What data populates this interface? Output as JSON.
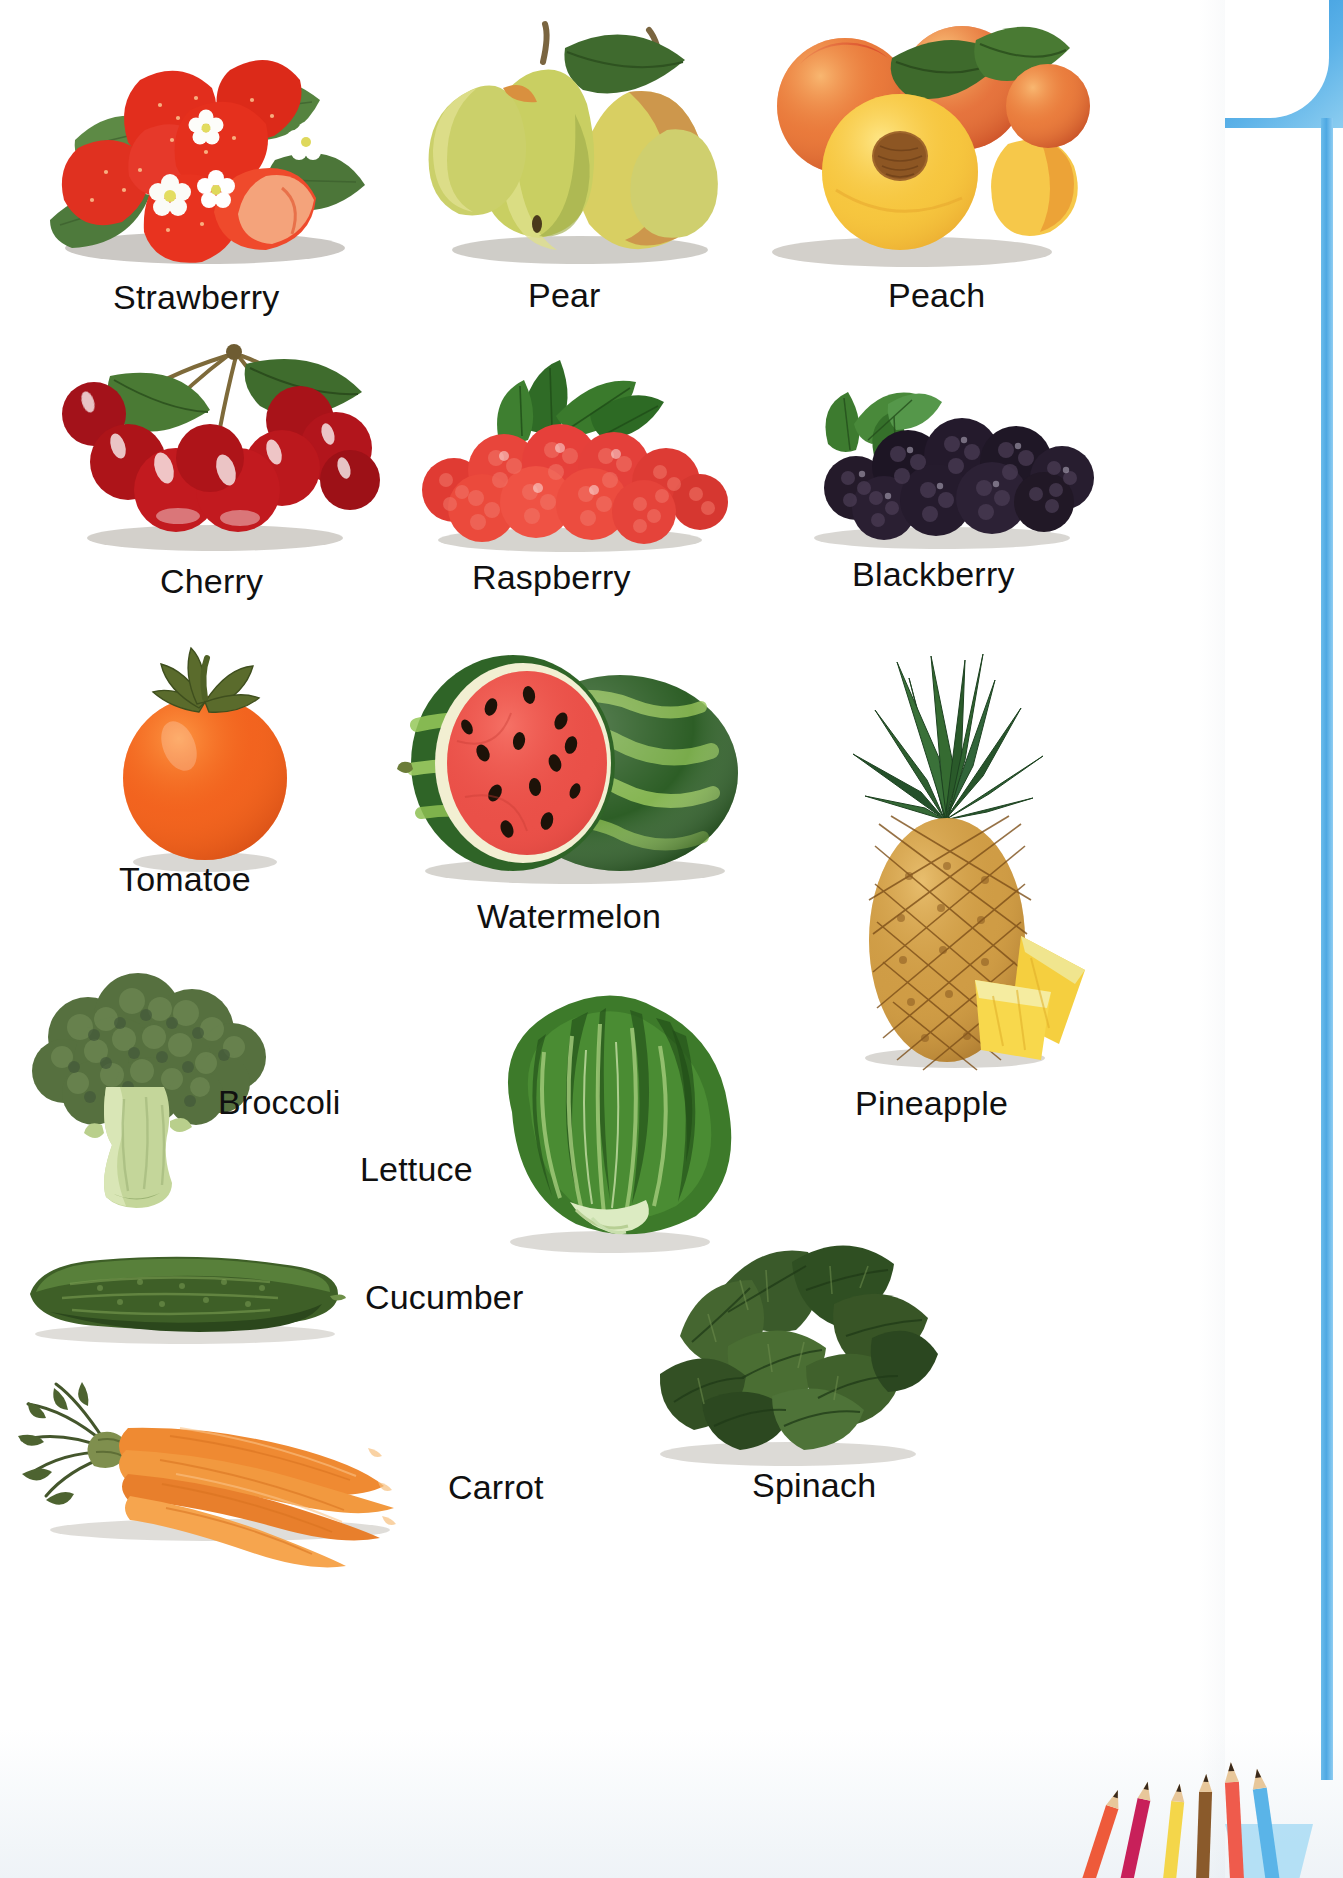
{
  "page": {
    "kind": "picture-dictionary-page",
    "background": "#ffffff",
    "accent_blue": "#4ea8e3",
    "label_color": "#101010"
  },
  "items": [
    {
      "id": "strawberry",
      "label": "Strawberry",
      "category": "fruit",
      "color": "#e0301e",
      "row": 1,
      "col": 1
    },
    {
      "id": "pear",
      "label": "Pear",
      "category": "fruit",
      "color": "#c6d26a",
      "row": 1,
      "col": 2
    },
    {
      "id": "peach",
      "label": "Peach",
      "category": "fruit",
      "color": "#f2a03c",
      "row": 1,
      "col": 3
    },
    {
      "id": "cherry",
      "label": "Cherry",
      "category": "fruit",
      "color": "#b8151b",
      "row": 2,
      "col": 1
    },
    {
      "id": "raspberry",
      "label": "Raspberry",
      "category": "fruit",
      "color": "#e23b35",
      "row": 2,
      "col": 2
    },
    {
      "id": "blackberry",
      "label": "Blackberry",
      "category": "fruit",
      "color": "#241b2b",
      "row": 2,
      "col": 3
    },
    {
      "id": "tomatoe",
      "label": "Tomatoe",
      "category": "fruit",
      "color": "#f2621f",
      "row": 3,
      "col": 1
    },
    {
      "id": "watermelon",
      "label": "Watermelon",
      "category": "fruit",
      "color": "#2f6b2a",
      "row": 3,
      "col": 2
    },
    {
      "id": "pineapple",
      "label": "Pineapple",
      "category": "fruit",
      "color": "#d79a3e",
      "row": 3,
      "col": 3
    },
    {
      "id": "broccoli",
      "label": "Broccoli",
      "category": "vegetable",
      "color": "#4f6b3d",
      "row": 4,
      "col": 1
    },
    {
      "id": "lettuce",
      "label": "Lettuce",
      "category": "vegetable",
      "color": "#4f8a34",
      "row": 4,
      "col": 2
    },
    {
      "id": "cucumber",
      "label": "Cucumber",
      "category": "vegetable",
      "color": "#3d5a2a",
      "row": 5,
      "col": 1
    },
    {
      "id": "spinach",
      "label": "Spinach",
      "category": "vegetable",
      "color": "#3c5c2d",
      "row": 5,
      "col": 2
    },
    {
      "id": "carrot",
      "label": "Carrot",
      "category": "vegetable",
      "color": "#ef8a32",
      "row": 6,
      "col": 1
    }
  ],
  "decorations": {
    "corner_tab": "blue-rounded-corner",
    "side_rail": "blue-vertical-rail",
    "pencils": {
      "name": "colored-pencils",
      "colors": [
        "#ee5a3a",
        "#c8205a",
        "#f4d64a",
        "#8a5a2b",
        "#ef5b4c",
        "#5ab4e8"
      ],
      "cup_color": "#a9dcf5"
    }
  }
}
